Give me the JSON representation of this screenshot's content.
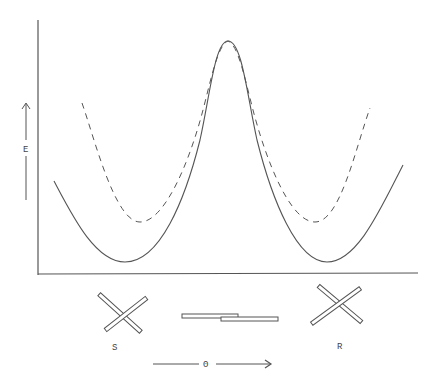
{
  "diagram": {
    "type": "potential energy curve",
    "y_axis": {
      "label": "E",
      "direction": "up-arrow"
    },
    "x_axis": {
      "label": "Θ",
      "direction": "right-arrow"
    },
    "curves": [
      {
        "name": "solid",
        "style": "solid",
        "shape": "double well with central barrier"
      },
      {
        "name": "dashed",
        "style": "dashed",
        "shape": "double well, higher minima, merges with solid at barrier top"
      }
    ],
    "conformers": [
      {
        "label": "S",
        "position": "left minimum",
        "shape": "crossed rods"
      },
      {
        "label": "",
        "position": "barrier top",
        "shape": "parallel overlapping rods"
      },
      {
        "label": "R",
        "position": "right minimum",
        "shape": "crossed rods (mirror)"
      }
    ]
  },
  "labels": {
    "energy": "E",
    "angle": "Θ",
    "left_conformer": "S",
    "right_conformer": "R"
  },
  "colors": {
    "line": "#555555",
    "background": "#ffffff"
  }
}
